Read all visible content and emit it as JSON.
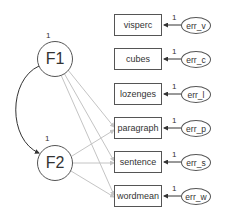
{
  "diagram": {
    "type": "structural equation model path diagram",
    "latents": [
      {
        "id": "F1",
        "label": "F1",
        "variance_label": "1"
      },
      {
        "id": "F2",
        "label": "F2",
        "variance_label": "1"
      }
    ],
    "observed": [
      {
        "label": "visperc",
        "error": "err_v",
        "error_loading": "1"
      },
      {
        "label": "cubes",
        "error": "err_c",
        "error_loading": "1"
      },
      {
        "label": "lozenges",
        "error": "err_l",
        "error_loading": "1"
      },
      {
        "label": "paragraph",
        "error": "err_p",
        "error_loading": "1"
      },
      {
        "label": "sentence",
        "error": "err_s",
        "error_loading": "1"
      },
      {
        "label": "wordmean",
        "error": "err_w",
        "error_loading": "1"
      }
    ],
    "paths": [
      {
        "from": "F1",
        "to": "paragraph"
      },
      {
        "from": "F1",
        "to": "sentence"
      },
      {
        "from": "F1",
        "to": "wordmean"
      },
      {
        "from": "F2",
        "to": "paragraph"
      },
      {
        "from": "F2",
        "to": "sentence"
      },
      {
        "from": "F2",
        "to": "wordmean"
      }
    ],
    "covariances": [
      {
        "between": [
          "F1",
          "F2"
        ]
      }
    ],
    "colors": {
      "stroke": "#555555",
      "path": "#c4c4c4",
      "text": "#333333"
    }
  }
}
